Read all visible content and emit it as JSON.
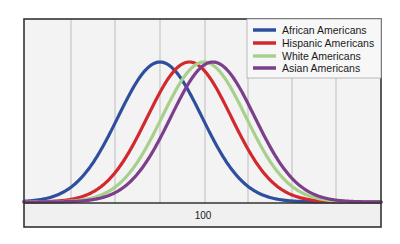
{
  "chart_data": {
    "type": "line",
    "title": "",
    "xlabel": "",
    "ylabel": "",
    "x_tick_labels": [
      {
        "value": 100,
        "label": "100"
      }
    ],
    "grid": {
      "vertical": true,
      "horizontal": false
    },
    "legend_position": "upper right",
    "x_range": [
      40,
      160
    ],
    "series": [
      {
        "name": "African Americans",
        "color": "#2f4f9e",
        "mean": 85,
        "relative_peak": 1.0
      },
      {
        "name": "Hispanic Americans",
        "color": "#d2282e",
        "mean": 95,
        "relative_peak": 1.0
      },
      {
        "name": "White Americans",
        "color": "#a8d08d",
        "mean": 100,
        "relative_peak": 1.0
      },
      {
        "name": "Asian Americans",
        "color": "#7b3f8c",
        "mean": 103,
        "relative_peak": 1.0
      }
    ],
    "annotations": []
  },
  "legend": {
    "items": [
      {
        "label": "African Americans",
        "color": "#2f4f9e"
      },
      {
        "label": "Hispanic Americans",
        "color": "#d2282e"
      },
      {
        "label": "White Americans",
        "color": "#a8d08d"
      },
      {
        "label": "Asian Americans",
        "color": "#7b3f8c"
      }
    ]
  },
  "axis": {
    "tick_label": "100"
  },
  "style": {
    "background": "#f2f2f2",
    "frame": "#333333",
    "grid": "#c4c4c4"
  }
}
